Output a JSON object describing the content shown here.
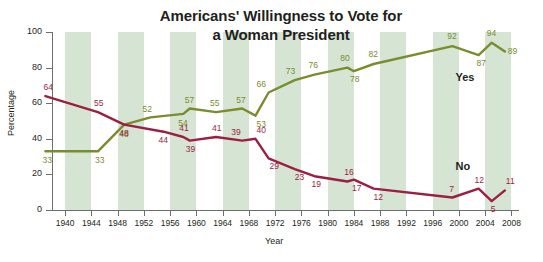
{
  "chart_data": {
    "type": "line",
    "title": "Americans'  Willingness to Vote for a Woman President",
    "title_line1": "Americans'  Willingness to Vote for",
    "title_line2": "a Woman President",
    "xlabel": "Year",
    "ylabel": "Percentage",
    "xlim": [
      1938,
      2009
    ],
    "ylim": [
      0,
      100
    ],
    "yticks": [
      0,
      20,
      40,
      60,
      80,
      100
    ],
    "ytick_labels": [
      "0",
      "20",
      "40",
      "60",
      "80",
      "100"
    ],
    "xticks": [
      1940,
      1944,
      1948,
      1952,
      1956,
      1960,
      1964,
      1968,
      1972,
      1976,
      1980,
      1984,
      1988,
      1992,
      1996,
      2000,
      2004,
      2008
    ],
    "xtick_labels": [
      "1940",
      "1944",
      "1948",
      "1952",
      "1956",
      "1960",
      "1964",
      "1968",
      "1972",
      "1976",
      "1980",
      "1984",
      "1988",
      "1992",
      "1996",
      "2000",
      "2004",
      "2008"
    ],
    "grid": false,
    "legend_position": "inline-right",
    "banding": "alternating vertical green bands every 4 years",
    "band_color": "#d6e4d4",
    "series": [
      {
        "name": "Yes",
        "color": "#7a8c2e",
        "points": [
          {
            "x": 1937,
            "y": 33,
            "label": "33"
          },
          {
            "x": 1945,
            "y": 33,
            "label": "33"
          },
          {
            "x": 1949,
            "y": 48,
            "label": "48"
          },
          {
            "x": 1953,
            "y": 52,
            "label": "52"
          },
          {
            "x": 1958,
            "y": 54,
            "label": "54"
          },
          {
            "x": 1959,
            "y": 57,
            "label": "57"
          },
          {
            "x": 1963,
            "y": 55,
            "label": "55"
          },
          {
            "x": 1967,
            "y": 57,
            "label": "57"
          },
          {
            "x": 1969,
            "y": 53,
            "label": "53"
          },
          {
            "x": 1971,
            "y": 66,
            "label": "66"
          },
          {
            "x": 1975,
            "y": 73,
            "label": "73"
          },
          {
            "x": 1978,
            "y": 76,
            "label": "76"
          },
          {
            "x": 1983,
            "y": 80,
            "label": "80"
          },
          {
            "x": 1984,
            "y": 78,
            "label": "78"
          },
          {
            "x": 1987,
            "y": 82,
            "label": "82"
          },
          {
            "x": 1999,
            "y": 92,
            "label": "92"
          },
          {
            "x": 2003,
            "y": 87,
            "label": "87"
          },
          {
            "x": 2005,
            "y": 94,
            "label": "94"
          },
          {
            "x": 2007,
            "y": 89,
            "label": "89"
          }
        ]
      },
      {
        "name": "No",
        "color": "#9b1f42",
        "points": [
          {
            "x": 1937,
            "y": 64,
            "label": "64"
          },
          {
            "x": 1945,
            "y": 55,
            "label": "55"
          },
          {
            "x": 1949,
            "y": 48,
            "label": "48"
          },
          {
            "x": 1955,
            "y": 44,
            "label": "44"
          },
          {
            "x": 1958,
            "y": 41,
            "label": "41"
          },
          {
            "x": 1959,
            "y": 39,
            "label": "39"
          },
          {
            "x": 1963,
            "y": 41,
            "label": "41"
          },
          {
            "x": 1967,
            "y": 39,
            "label": "39"
          },
          {
            "x": 1969,
            "y": 40,
            "label": "40"
          },
          {
            "x": 1971,
            "y": 29,
            "label": "29"
          },
          {
            "x": 1975,
            "y": 23,
            "label": "23"
          },
          {
            "x": 1978,
            "y": 19,
            "label": "19"
          },
          {
            "x": 1983,
            "y": 16,
            "label": "16"
          },
          {
            "x": 1984,
            "y": 17,
            "label": "17"
          },
          {
            "x": 1987,
            "y": 12,
            "label": "12"
          },
          {
            "x": 1999,
            "y": 7,
            "label": "7"
          },
          {
            "x": 2003,
            "y": 12,
            "label": "12"
          },
          {
            "x": 2005,
            "y": 5,
            "label": "5"
          },
          {
            "x": 2007,
            "y": 11,
            "label": "11"
          }
        ]
      }
    ],
    "annotations": [
      {
        "text": "Yes",
        "x": 2001,
        "y": 74
      },
      {
        "text": "No",
        "x": 2001,
        "y": 24
      }
    ]
  }
}
